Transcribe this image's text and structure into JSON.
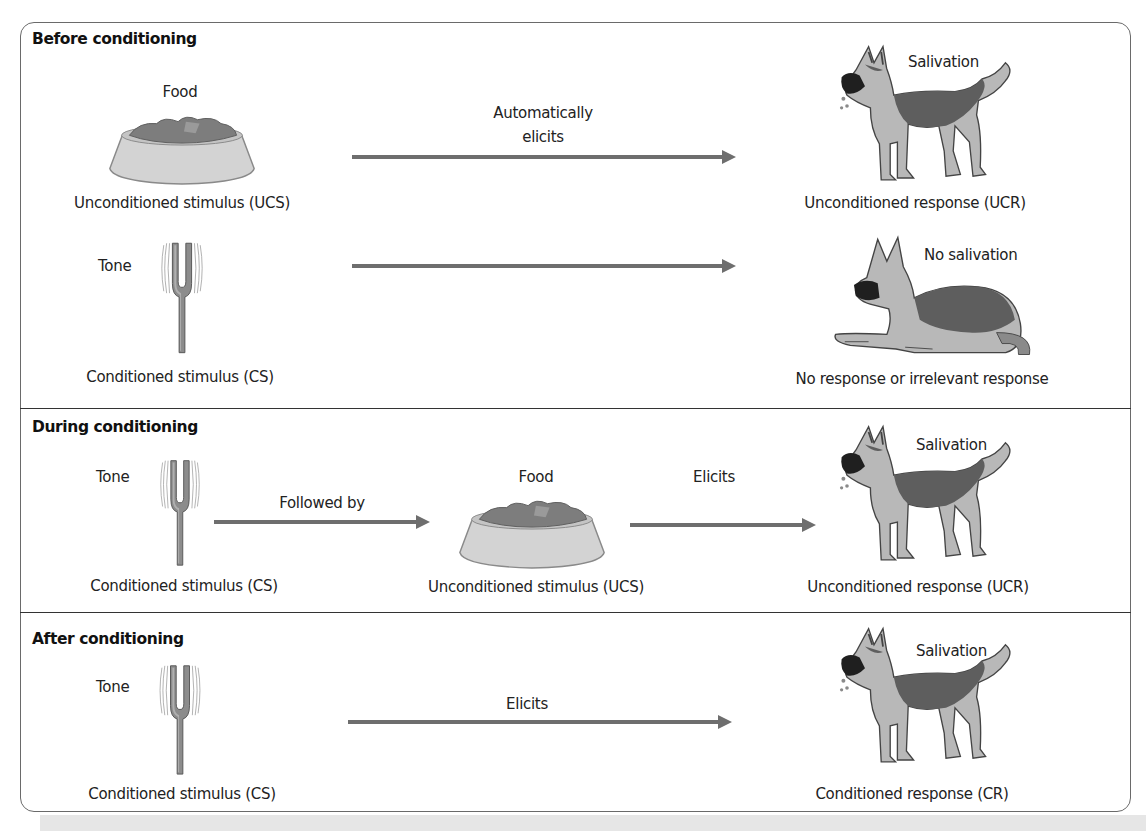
{
  "diagram": {
    "type": "classical-conditioning",
    "colors": {
      "arrow": "#6e6e6e",
      "frame": "#6a6a6a",
      "divider": "#333333",
      "dog_dark": "#5a5a5a",
      "dog_light": "#b8b8b8",
      "bowl": "#d0d0d0",
      "food": "#7a7a7a"
    },
    "sections": [
      {
        "title": "Before conditioning",
        "rows": [
          {
            "stimulus": {
              "label": "Food",
              "caption": "Unconditioned stimulus (UCS)",
              "icon": "food-bowl-icon"
            },
            "arrow": {
              "label_line1": "Automatically",
              "label_line2": "elicits"
            },
            "response": {
              "label": "Salivation",
              "caption": "Unconditioned response (UCR)",
              "icon": "salivating-dog-icon"
            }
          },
          {
            "stimulus": {
              "label": "Tone",
              "caption": "Conditioned stimulus (CS)",
              "icon": "tuning-fork-icon"
            },
            "arrow": {
              "label": ""
            },
            "response": {
              "label": "No salivation",
              "caption": "No response or irrelevant response",
              "icon": "lying-dog-icon"
            }
          }
        ]
      },
      {
        "title": "During conditioning",
        "rows": [
          {
            "stimulus": {
              "label": "Tone",
              "caption": "Conditioned stimulus (CS)",
              "icon": "tuning-fork-icon"
            },
            "arrow1": {
              "label": "Followed by"
            },
            "middle": {
              "label": "Food",
              "caption": "Unconditioned stimulus (UCS)",
              "icon": "food-bowl-icon"
            },
            "arrow2": {
              "label": "Elicits"
            },
            "response": {
              "label": "Salivation",
              "caption": "Unconditioned response (UCR)",
              "icon": "salivating-dog-icon"
            }
          }
        ]
      },
      {
        "title": "After conditioning",
        "rows": [
          {
            "stimulus": {
              "label": "Tone",
              "caption": "Conditioned stimulus (CS)",
              "icon": "tuning-fork-icon"
            },
            "arrow": {
              "label": "Elicits"
            },
            "response": {
              "label": "Salivation",
              "caption": "Conditioned response (CR)",
              "icon": "salivating-dog-icon"
            }
          }
        ]
      }
    ]
  }
}
